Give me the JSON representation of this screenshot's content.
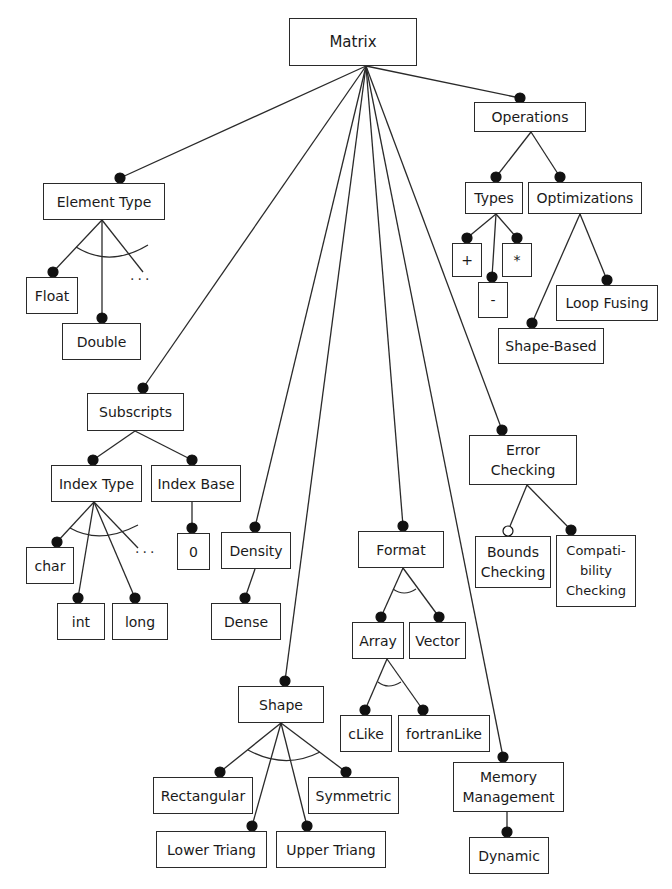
{
  "diagram": {
    "colors": {
      "line": "#2a2a2a",
      "fill": "#ffffff",
      "text": "#1a1a1a"
    },
    "nodes": [
      {
        "id": "matrix",
        "label": "Matrix",
        "x": 289,
        "y": 18,
        "w": 128,
        "h": 48
      },
      {
        "id": "operations",
        "label": "Operations",
        "x": 474,
        "y": 102,
        "w": 112,
        "h": 30
      },
      {
        "id": "types",
        "label": "Types",
        "x": 465,
        "y": 182,
        "w": 58,
        "h": 32
      },
      {
        "id": "optimizations",
        "label": "Optimizations",
        "x": 528,
        "y": 182,
        "w": 114,
        "h": 32
      },
      {
        "id": "plus",
        "label": "+",
        "x": 452,
        "y": 243,
        "w": 30,
        "h": 34
      },
      {
        "id": "times",
        "label": "*",
        "x": 502,
        "y": 243,
        "w": 30,
        "h": 34
      },
      {
        "id": "minus",
        "label": "-",
        "x": 478,
        "y": 282,
        "w": 30,
        "h": 36
      },
      {
        "id": "loop_fusing",
        "label": "Loop Fusing",
        "x": 556,
        "y": 285,
        "w": 102,
        "h": 36
      },
      {
        "id": "shape_based",
        "label": "Shape-Based",
        "x": 498,
        "y": 328,
        "w": 106,
        "h": 36
      },
      {
        "id": "element_type",
        "label": "Element Type",
        "x": 43,
        "y": 183,
        "w": 122,
        "h": 37
      },
      {
        "id": "float",
        "label": "Float",
        "x": 26,
        "y": 277,
        "w": 52,
        "h": 37
      },
      {
        "id": "double",
        "label": "Double",
        "x": 62,
        "y": 323,
        "w": 79,
        "h": 37
      },
      {
        "id": "subscripts",
        "label": "Subscripts",
        "x": 87,
        "y": 393,
        "w": 97,
        "h": 38
      },
      {
        "id": "index_type",
        "label": "Index Type",
        "x": 51,
        "y": 465,
        "w": 91,
        "h": 37
      },
      {
        "id": "index_base",
        "label": "Index Base",
        "x": 151,
        "y": 465,
        "w": 90,
        "h": 37
      },
      {
        "id": "char",
        "label": "char",
        "x": 26,
        "y": 547,
        "w": 48,
        "h": 37
      },
      {
        "id": "zero",
        "label": "0",
        "x": 177,
        "y": 533,
        "w": 33,
        "h": 37
      },
      {
        "id": "density",
        "label": "Density",
        "x": 221,
        "y": 532,
        "w": 70,
        "h": 37
      },
      {
        "id": "int",
        "label": "int",
        "x": 57,
        "y": 603,
        "w": 48,
        "h": 37
      },
      {
        "id": "long",
        "label": "long",
        "x": 112,
        "y": 603,
        "w": 56,
        "h": 37
      },
      {
        "id": "dense",
        "label": "Dense",
        "x": 211,
        "y": 603,
        "w": 70,
        "h": 37
      },
      {
        "id": "error_checking",
        "label": "Error\nChecking",
        "x": 469,
        "y": 435,
        "w": 108,
        "h": 50
      },
      {
        "id": "bounds_checking",
        "label": "Bounds\nChecking",
        "x": 475,
        "y": 536,
        "w": 76,
        "h": 52
      },
      {
        "id": "compat_checking",
        "label": "Compati-\nbility\nChecking",
        "x": 556,
        "y": 535,
        "w": 80,
        "h": 72
      },
      {
        "id": "format",
        "label": "Format",
        "x": 358,
        "y": 531,
        "w": 86,
        "h": 37
      },
      {
        "id": "array",
        "label": "Array",
        "x": 352,
        "y": 622,
        "w": 52,
        "h": 37
      },
      {
        "id": "vector",
        "label": "Vector",
        "x": 409,
        "y": 622,
        "w": 57,
        "h": 37
      },
      {
        "id": "clike",
        "label": "cLike",
        "x": 340,
        "y": 715,
        "w": 52,
        "h": 37
      },
      {
        "id": "fortranlike",
        "label": "fortranLike",
        "x": 398,
        "y": 715,
        "w": 92,
        "h": 37
      },
      {
        "id": "shape",
        "label": "Shape",
        "x": 238,
        "y": 686,
        "w": 86,
        "h": 37
      },
      {
        "id": "rectangular",
        "label": "Rectangular",
        "x": 153,
        "y": 777,
        "w": 100,
        "h": 37
      },
      {
        "id": "symmetric",
        "label": "Symmetric",
        "x": 308,
        "y": 777,
        "w": 91,
        "h": 37
      },
      {
        "id": "lower_triang",
        "label": "Lower Triang",
        "x": 156,
        "y": 831,
        "w": 111,
        "h": 37
      },
      {
        "id": "upper_triang",
        "label": "Upper Triang",
        "x": 276,
        "y": 831,
        "w": 110,
        "h": 37
      },
      {
        "id": "memory_mgmt",
        "label": "Memory\nManagement",
        "x": 453,
        "y": 762,
        "w": 111,
        "h": 50
      },
      {
        "id": "dynamic",
        "label": "Dynamic",
        "x": 469,
        "y": 837,
        "w": 80,
        "h": 37
      }
    ],
    "edges": [
      {
        "from": [
          366,
          66
        ],
        "to": [
          120,
          178
        ],
        "end": "filled"
      },
      {
        "from": [
          366,
          66
        ],
        "to": [
          520,
          98
        ],
        "end": "filled"
      },
      {
        "from": [
          366,
          66
        ],
        "to": [
          143,
          388
        ],
        "end": "filled"
      },
      {
        "from": [
          366,
          66
        ],
        "to": [
          255,
          527
        ],
        "end": "filled"
      },
      {
        "from": [
          366,
          66
        ],
        "to": [
          403,
          526
        ],
        "end": "filled"
      },
      {
        "from": [
          366,
          66
        ],
        "to": [
          285,
          681
        ],
        "end": "filled"
      },
      {
        "from": [
          366,
          66
        ],
        "to": [
          502,
          430
        ],
        "end": "filled"
      },
      {
        "from": [
          366,
          66
        ],
        "to": [
          503,
          757
        ],
        "end": "filled"
      },
      {
        "from": [
          531,
          132
        ],
        "to": [
          496,
          177
        ],
        "end": "filled"
      },
      {
        "from": [
          531,
          132
        ],
        "to": [
          560,
          177
        ],
        "end": "filled"
      },
      {
        "from": [
          496,
          214
        ],
        "to": [
          467,
          238
        ],
        "end": "filled"
      },
      {
        "from": [
          496,
          214
        ],
        "to": [
          517,
          238
        ],
        "end": "filled"
      },
      {
        "from": [
          496,
          214
        ],
        "to": [
          492,
          277
        ],
        "end": "filled"
      },
      {
        "from": [
          580,
          214
        ],
        "to": [
          607,
          280
        ],
        "end": "filled"
      },
      {
        "from": [
          580,
          214
        ],
        "to": [
          532,
          323
        ],
        "end": "filled"
      },
      {
        "from": [
          102,
          220
        ],
        "to": [
          53,
          272
        ],
        "end": "filled"
      },
      {
        "from": [
          102,
          220
        ],
        "to": [
          102,
          318
        ],
        "end": "filled"
      },
      {
        "from": [
          102,
          220
        ],
        "to": [
          143,
          272
        ],
        "end": "none"
      },
      {
        "from": [
          135,
          431
        ],
        "to": [
          93,
          460
        ],
        "end": "filled"
      },
      {
        "from": [
          135,
          431
        ],
        "to": [
          192,
          460
        ],
        "end": "filled"
      },
      {
        "from": [
          94,
          502
        ],
        "to": [
          57,
          542
        ],
        "end": "filled"
      },
      {
        "from": [
          94,
          502
        ],
        "to": [
          78,
          598
        ],
        "end": "filled"
      },
      {
        "from": [
          94,
          502
        ],
        "to": [
          135,
          598
        ],
        "end": "filled"
      },
      {
        "from": [
          94,
          502
        ],
        "to": [
          138,
          548
        ],
        "end": "none"
      },
      {
        "from": [
          192,
          502
        ],
        "to": [
          192,
          528
        ],
        "end": "filled"
      },
      {
        "from": [
          255,
          569
        ],
        "to": [
          245,
          598
        ],
        "end": "filled"
      },
      {
        "from": [
          527,
          485
        ],
        "to": [
          508,
          531
        ],
        "end": "hollow"
      },
      {
        "from": [
          527,
          485
        ],
        "to": [
          571,
          530
        ],
        "end": "filled"
      },
      {
        "from": [
          403,
          568
        ],
        "to": [
          381,
          617
        ],
        "end": "filled"
      },
      {
        "from": [
          403,
          568
        ],
        "to": [
          439,
          617
        ],
        "end": "filled"
      },
      {
        "from": [
          387,
          659
        ],
        "to": [
          365,
          710
        ],
        "end": "filled"
      },
      {
        "from": [
          387,
          659
        ],
        "to": [
          423,
          710
        ],
        "end": "filled"
      },
      {
        "from": [
          281,
          723
        ],
        "to": [
          220,
          772
        ],
        "end": "filled"
      },
      {
        "from": [
          281,
          723
        ],
        "to": [
          346,
          772
        ],
        "end": "filled"
      },
      {
        "from": [
          281,
          723
        ],
        "to": [
          252,
          826
        ],
        "end": "filled"
      },
      {
        "from": [
          281,
          723
        ],
        "to": [
          307,
          826
        ],
        "end": "filled"
      },
      {
        "from": [
          507,
          812
        ],
        "to": [
          507,
          832
        ],
        "end": "filled"
      }
    ],
    "arcs": [
      {
        "label": "element-type-alternative-arc",
        "d": "M 76 247 Q 110 268 148 245"
      },
      {
        "label": "index-type-alternative-arc",
        "d": "M 70 528 Q 100 545 138 525"
      },
      {
        "label": "format-alternative-arc",
        "d": "M 393 589 Q 404 597 416 589"
      },
      {
        "label": "array-alternative-arc",
        "d": "M 378 682 Q 388 690 401 682"
      },
      {
        "label": "shape-alternative-arc",
        "d": "M 248 750 Q 285 770 320 752"
      }
    ],
    "ellipses": [
      {
        "label": "...",
        "x": 130,
        "y": 277
      },
      {
        "label": "...",
        "x": 135,
        "y": 550
      }
    ]
  }
}
